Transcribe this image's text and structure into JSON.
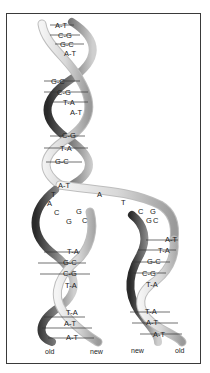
{
  "diagram": {
    "parent_helix": {
      "base_pairs": [
        "A-T",
        "C-G",
        "G-C",
        "A-T",
        "G-C",
        "C-G",
        "T-A",
        "A-T",
        "C-G",
        "T-A",
        "G-C",
        "A-T"
      ]
    },
    "replication_fork": {
      "left_unpaired": [
        "T",
        "A",
        "C",
        "G"
      ],
      "left_pairing": [
        "G",
        "C"
      ],
      "right_unpaired": [
        "A",
        "T"
      ],
      "right_pairing": [
        "C",
        "G",
        "G",
        "C"
      ]
    },
    "left_daughter": {
      "base_pairs": [
        "T-A",
        "G-C",
        "C-G",
        "T-A",
        "T-A",
        "A-T",
        "A-T"
      ],
      "strand_labels": [
        "old",
        "new"
      ]
    },
    "right_daughter": {
      "base_pairs": [
        "A-T",
        "T-A",
        "G-C",
        "C-G",
        "T-A",
        "T-A",
        "A-T",
        "A-T"
      ],
      "strand_labels": [
        "new",
        "old"
      ]
    }
  }
}
